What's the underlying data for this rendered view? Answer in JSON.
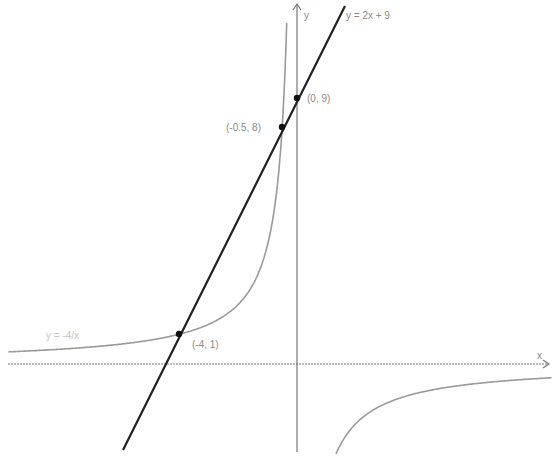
{
  "diagram": {
    "type": "function-graph",
    "axes": {
      "x_label": "x",
      "y_label": "y",
      "grid": false
    },
    "curves": [
      {
        "name": "hyperbola",
        "label": "y = -4/x",
        "equation": "y = -4/x",
        "color": "#999999"
      },
      {
        "name": "line",
        "label": "y = 2x + 9",
        "equation": "y = 2x + 9",
        "color": "#222222"
      }
    ],
    "points": [
      {
        "label": "(0, 9)",
        "x": 0,
        "y": 9
      },
      {
        "label": "(-0.5, 8)",
        "x": -0.5,
        "y": 8
      },
      {
        "label": "(-4, 1)",
        "x": -4,
        "y": 1
      }
    ]
  },
  "labels": {
    "line_label": "y = 2x + 9",
    "curve_label": "y = -4/x",
    "x_axis": "x",
    "y_axis": "y",
    "p1": "(0, 9)",
    "p2": "(-0.5, 8)",
    "p3": "(-4, 1)"
  }
}
